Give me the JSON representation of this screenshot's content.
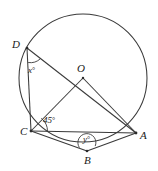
{
  "figure": {
    "shape": "circle-with-inscribed-quadrilateral",
    "stroke_color": "#3a3a3a",
    "background_color": "#ffffff",
    "circle": {
      "cx": 83,
      "cy": 78,
      "r": 64
    },
    "center_point": {
      "label": "O",
      "x": 83,
      "y": 78
    },
    "points": [
      {
        "label": "A",
        "x": 136,
        "y": 133
      },
      {
        "label": "B",
        "x": 87,
        "y": 151
      },
      {
        "label": "C",
        "x": 31,
        "y": 131
      },
      {
        "label": "D",
        "x": 27,
        "y": 48
      }
    ],
    "segments": [
      {
        "from": "D",
        "to": "C"
      },
      {
        "from": "D",
        "to": "A"
      },
      {
        "from": "C",
        "to": "A"
      },
      {
        "from": "C",
        "to": "O"
      },
      {
        "from": "O",
        "to": "A"
      },
      {
        "from": "C",
        "to": "B"
      },
      {
        "from": "B",
        "to": "A"
      }
    ],
    "angles": [
      {
        "name": "angle-at-D",
        "label": "x",
        "unit": "°",
        "vertex": "D"
      },
      {
        "name": "angle-at-C",
        "label": "45",
        "unit": "°",
        "vertex": "C",
        "value": 45
      },
      {
        "name": "angle-at-B",
        "label": "y",
        "unit": "°",
        "vertex": "B"
      }
    ],
    "labels": {
      "A": "A",
      "B": "B",
      "C": "C",
      "D": "D",
      "O": "O",
      "x_angle": "x",
      "y_angle": "y",
      "c_angle": "45",
      "degree_symbol": "°"
    }
  }
}
